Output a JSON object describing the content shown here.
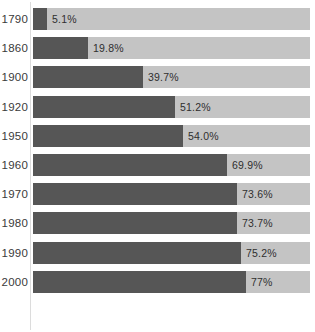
{
  "chart_data": {
    "type": "bar",
    "orientation": "horizontal",
    "title": "",
    "subtitle": "",
    "xlabel": "",
    "ylabel": "",
    "xlim": [
      0,
      100
    ],
    "grid": false,
    "legend": null,
    "categories": [
      "1790",
      "1860",
      "1900",
      "1920",
      "1950",
      "1960",
      "1970",
      "1980",
      "1990",
      "2000"
    ],
    "values": [
      5.1,
      19.8,
      39.7,
      51.2,
      54.0,
      69.9,
      73.6,
      73.7,
      75.2,
      77
    ],
    "value_labels": [
      "5.1%",
      "19.8%",
      "39.7%",
      "51.2%",
      "54.0%",
      "69.9%",
      "73.6%",
      "73.7%",
      "75.2%",
      "77%"
    ],
    "series": [
      {
        "name": "filled",
        "color": "#565656",
        "values": [
          5.1,
          19.8,
          39.7,
          51.2,
          54.0,
          69.9,
          73.6,
          73.7,
          75.2,
          77
        ]
      },
      {
        "name": "remainder",
        "color": "#c4c4c4",
        "values": [
          94.9,
          80.2,
          60.3,
          48.8,
          46.0,
          30.1,
          26.4,
          26.3,
          24.8,
          23
        ]
      }
    ]
  },
  "rows": [
    {
      "year": "1790",
      "value": 5.1,
      "value_label": "5.1%"
    },
    {
      "year": "1860",
      "value": 19.8,
      "value_label": "19.8%"
    },
    {
      "year": "1900",
      "value": 39.7,
      "value_label": "39.7%"
    },
    {
      "year": "1920",
      "value": 51.2,
      "value_label": "51.2%"
    },
    {
      "year": "1950",
      "value": 54.0,
      "value_label": "54.0%"
    },
    {
      "year": "1960",
      "value": 69.9,
      "value_label": "69.9%"
    },
    {
      "year": "1970",
      "value": 73.6,
      "value_label": "73.6%"
    },
    {
      "year": "1980",
      "value": 73.7,
      "value_label": "73.7%"
    },
    {
      "year": "1990",
      "value": 75.2,
      "value_label": "75.2%"
    },
    {
      "year": "2000",
      "value": 77,
      "value_label": "77%"
    }
  ],
  "colors": {
    "bar_fill": "#565656",
    "bar_track": "#c4c4c4",
    "axis_line": "#dcdcdc",
    "background": "#ffffff",
    "year_text": "#3a3a3a",
    "value_text": "#2f2f2f"
  }
}
